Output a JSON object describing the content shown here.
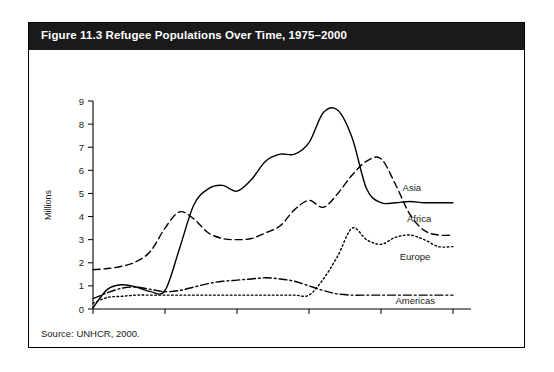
{
  "figure": {
    "title": "Figure 11.3 Refugee Populations Over Time, 1975–2000",
    "source": "Source: UNHCR, 2000."
  },
  "chart_data": {
    "type": "line",
    "title": "Figure 11.3 Refugee Populations Over Time, 1975–2000",
    "xlabel": "",
    "ylabel": "Millions",
    "xlim": [
      1975,
      2000
    ],
    "ylim": [
      0,
      9
    ],
    "xticks": [
      1975,
      1980,
      1985,
      1990,
      1995,
      2000
    ],
    "yticks": [
      0,
      1,
      2,
      3,
      4,
      5,
      6,
      7,
      8,
      9
    ],
    "grid": false,
    "legend": "inline-right-labels",
    "x": [
      1975,
      1976,
      1977,
      1978,
      1979,
      1980,
      1981,
      1982,
      1983,
      1984,
      1985,
      1986,
      1987,
      1988,
      1989,
      1990,
      1991,
      1992,
      1993,
      1994,
      1995,
      1996,
      1997,
      1998,
      1999,
      2000
    ],
    "series": [
      {
        "name": "Asia",
        "style": "solid",
        "values": [
          0.05,
          0.85,
          1.05,
          0.95,
          0.75,
          0.8,
          2.6,
          4.5,
          5.2,
          5.35,
          5.1,
          5.6,
          6.4,
          6.7,
          6.7,
          7.2,
          8.5,
          8.6,
          7.4,
          5.2,
          4.6,
          4.6,
          4.65,
          4.6,
          4.6,
          4.6
        ]
      },
      {
        "name": "Africa",
        "style": "dashed",
        "values": [
          1.7,
          1.75,
          1.85,
          2.05,
          2.5,
          3.5,
          4.2,
          3.9,
          3.3,
          3.05,
          3.0,
          3.05,
          3.3,
          3.6,
          4.3,
          4.7,
          4.4,
          5.0,
          5.8,
          6.4,
          6.5,
          5.4,
          4.1,
          3.4,
          3.2,
          3.2
        ]
      },
      {
        "name": "Europe",
        "style": "dotted",
        "values": [
          0.25,
          0.5,
          0.55,
          0.6,
          0.6,
          0.6,
          0.6,
          0.6,
          0.6,
          0.6,
          0.6,
          0.6,
          0.6,
          0.6,
          0.6,
          0.6,
          1.3,
          2.3,
          3.5,
          3.0,
          2.8,
          3.1,
          3.2,
          3.0,
          2.7,
          2.7
        ]
      },
      {
        "name": "Americas",
        "style": "dashdot",
        "values": [
          0.45,
          0.7,
          0.9,
          0.95,
          0.85,
          0.75,
          0.8,
          0.95,
          1.1,
          1.2,
          1.25,
          1.3,
          1.35,
          1.3,
          1.2,
          1.0,
          0.8,
          0.65,
          0.6,
          0.6,
          0.6,
          0.6,
          0.6,
          0.6,
          0.6,
          0.6
        ]
      }
    ],
    "series_labels": [
      {
        "name": "Asia",
        "x": 1996.5,
        "y": 5.1
      },
      {
        "name": "Africa",
        "x": 1996.8,
        "y": 3.75
      },
      {
        "name": "Europe",
        "x": 1996.3,
        "y": 2.1
      },
      {
        "name": "Americas",
        "x": 1996.0,
        "y": 0.22
      }
    ]
  }
}
